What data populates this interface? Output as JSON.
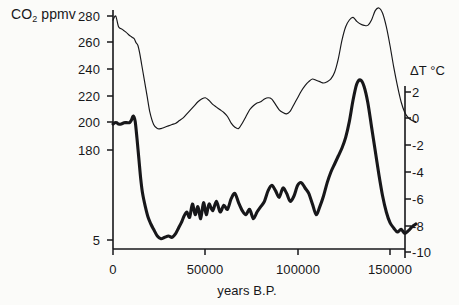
{
  "figure": {
    "background_color": "#fbfbf9",
    "ink_color": "#17171a"
  },
  "axes": {
    "left": {
      "title": "CO",
      "title_sub": "2",
      "title_suffix": " ppmv",
      "ticks": [
        {
          "label": "280",
          "value": 280,
          "y": 16
        },
        {
          "label": "260",
          "value": 260,
          "y": 42
        },
        {
          "label": "240",
          "value": 240,
          "y": 69
        },
        {
          "label": "220",
          "value": 220,
          "y": 96
        },
        {
          "label": "200",
          "value": 200,
          "y": 122
        },
        {
          "label": "180",
          "value": 180,
          "y": 150
        },
        {
          "label": "5",
          "value": 160,
          "y": 240
        }
      ]
    },
    "right": {
      "title": "ΔT °C",
      "ticks": [
        {
          "label": "2",
          "value": 2,
          "y": 92
        },
        {
          "label": "0",
          "value": 0,
          "y": 118
        },
        {
          "label": "-2",
          "value": -2,
          "y": 145
        },
        {
          "label": "-4",
          "value": -4,
          "y": 172
        },
        {
          "label": "-6",
          "value": -6,
          "y": 199
        },
        {
          "label": "-8",
          "value": -8,
          "y": 226
        },
        {
          "label": "-10",
          "value": -10,
          "y": 252
        }
      ]
    },
    "bottom": {
      "title": "years B.P.",
      "ticks": [
        {
          "label": "0",
          "value": 0,
          "x": 113
        },
        {
          "label": "50000",
          "value": 50000,
          "x": 205
        },
        {
          "label": "100000",
          "value": 100000,
          "x": 298
        },
        {
          "label": "150000",
          "value": 150000,
          "x": 390
        }
      ]
    }
  },
  "chart_data": {
    "type": "line",
    "title": "",
    "xlabel": "years B.P.",
    "ylabel": "CO2 ppmv",
    "y2label": "ΔT °C",
    "xlim": [
      0,
      165000
    ],
    "ylim": [
      155,
      288
    ],
    "y2lim": [
      -10.5,
      3.5
    ],
    "grid": false,
    "legend": "none",
    "series": [
      {
        "name": "CO2 ppmv",
        "axis": "left",
        "line_width": 1,
        "style": "thin",
        "x": [
          0,
          1500,
          3000,
          5000,
          7000,
          8500,
          9500,
          10500,
          11500,
          12500,
          13500,
          14500,
          15500,
          17000,
          18500,
          20000,
          22000,
          24000,
          26000,
          28000,
          30000,
          32000,
          34000,
          36000,
          38000,
          40000,
          42000,
          44000,
          46000,
          48000,
          50000,
          52000,
          54000,
          56000,
          58000,
          60000,
          62000,
          64000,
          66000,
          68000,
          70000,
          72000,
          74000,
          76000,
          78000,
          80000,
          82000,
          84000,
          86000,
          88000,
          90000,
          92000,
          94000,
          96000,
          98000,
          100000,
          102000,
          104000,
          106000,
          108000,
          110000,
          112000,
          114000,
          116000,
          118000,
          120000,
          122000,
          124000,
          126000,
          128000,
          130000,
          132000,
          134000,
          136000,
          138000,
          140000,
          142000,
          144000,
          146000,
          148000,
          150000,
          152000,
          154000,
          156000,
          158000,
          160000,
          162000,
          164000
        ],
        "y": [
          277,
          280,
          272,
          270,
          268,
          266,
          265,
          264,
          263,
          260,
          258,
          252,
          244,
          232,
          220,
          208,
          199,
          196,
          196,
          197,
          198,
          199,
          200,
          202,
          204,
          207,
          210,
          213,
          216,
          218,
          219,
          217,
          214,
          212,
          210,
          208,
          205,
          200,
          197,
          196,
          200,
          205,
          210,
          213,
          215,
          216,
          218,
          219,
          218,
          214,
          210,
          208,
          207,
          209,
          214,
          219,
          224,
          228,
          231,
          233,
          232,
          231,
          230,
          231,
          233,
          238,
          248,
          262,
          272,
          277,
          279,
          276,
          274,
          273,
          273,
          277,
          284,
          286,
          282,
          272,
          258,
          242,
          228,
          216,
          208,
          204,
          202,
          201
        ]
      },
      {
        "name": "ΔT °C",
        "axis": "right",
        "line_width": 3,
        "style": "thick",
        "x": [
          0,
          1000,
          2000,
          3000,
          4500,
          6000,
          7500,
          9000,
          10000,
          11000,
          12000,
          13000,
          14000,
          15000,
          16000,
          17500,
          19000,
          20500,
          22000,
          24000,
          26000,
          28000,
          30000,
          32000,
          34000,
          35500,
          37000,
          38500,
          40000,
          41500,
          43000,
          44500,
          46000,
          47500,
          49000,
          50500,
          52000,
          54000,
          56000,
          58000,
          60000,
          62000,
          64000,
          66000,
          68000,
          70000,
          72000,
          74000,
          76000,
          78000,
          80000,
          82000,
          84000,
          86000,
          88000,
          90000,
          92000,
          94000,
          96000,
          98000,
          100000,
          102000,
          104000,
          106000,
          108000,
          110000,
          112000,
          114000,
          116000,
          118000,
          120000,
          122000,
          124000,
          126000,
          128000,
          130000,
          132000,
          134000,
          136000,
          138000,
          140000,
          142000,
          144000,
          146000,
          148000,
          150000,
          152000,
          154000,
          156000,
          158000,
          160000,
          162000,
          164000
        ],
        "y": [
          -0.4,
          -0.3,
          -0.3,
          -0.4,
          -0.4,
          -0.3,
          -0.3,
          -0.3,
          -0.1,
          0.2,
          -0.2,
          -1.5,
          -3.0,
          -4.5,
          -5.6,
          -6.6,
          -7.4,
          -7.9,
          -8.3,
          -8.8,
          -9.0,
          -8.9,
          -8.8,
          -8.9,
          -8.6,
          -8.2,
          -7.8,
          -7.3,
          -7.0,
          -7.4,
          -6.4,
          -7.2,
          -6.6,
          -7.5,
          -6.3,
          -7.2,
          -6.4,
          -6.9,
          -6.2,
          -7.0,
          -6.5,
          -6.8,
          -6.0,
          -5.6,
          -6.3,
          -6.9,
          -7.2,
          -6.8,
          -7.5,
          -7.0,
          -6.6,
          -6.2,
          -5.4,
          -5.0,
          -5.4,
          -5.9,
          -5.2,
          -5.6,
          -6.2,
          -5.8,
          -5.0,
          -4.8,
          -5.2,
          -5.6,
          -6.4,
          -7.2,
          -6.6,
          -5.8,
          -4.8,
          -4.0,
          -3.4,
          -2.8,
          -2.2,
          -1.4,
          -0.2,
          1.4,
          2.6,
          2.9,
          2.4,
          1.2,
          -0.6,
          -2.4,
          -4.2,
          -5.8,
          -7.0,
          -7.8,
          -8.2,
          -8.5,
          -8.3,
          -8.6,
          -8.4,
          -8.1,
          -7.9
        ]
      }
    ]
  }
}
